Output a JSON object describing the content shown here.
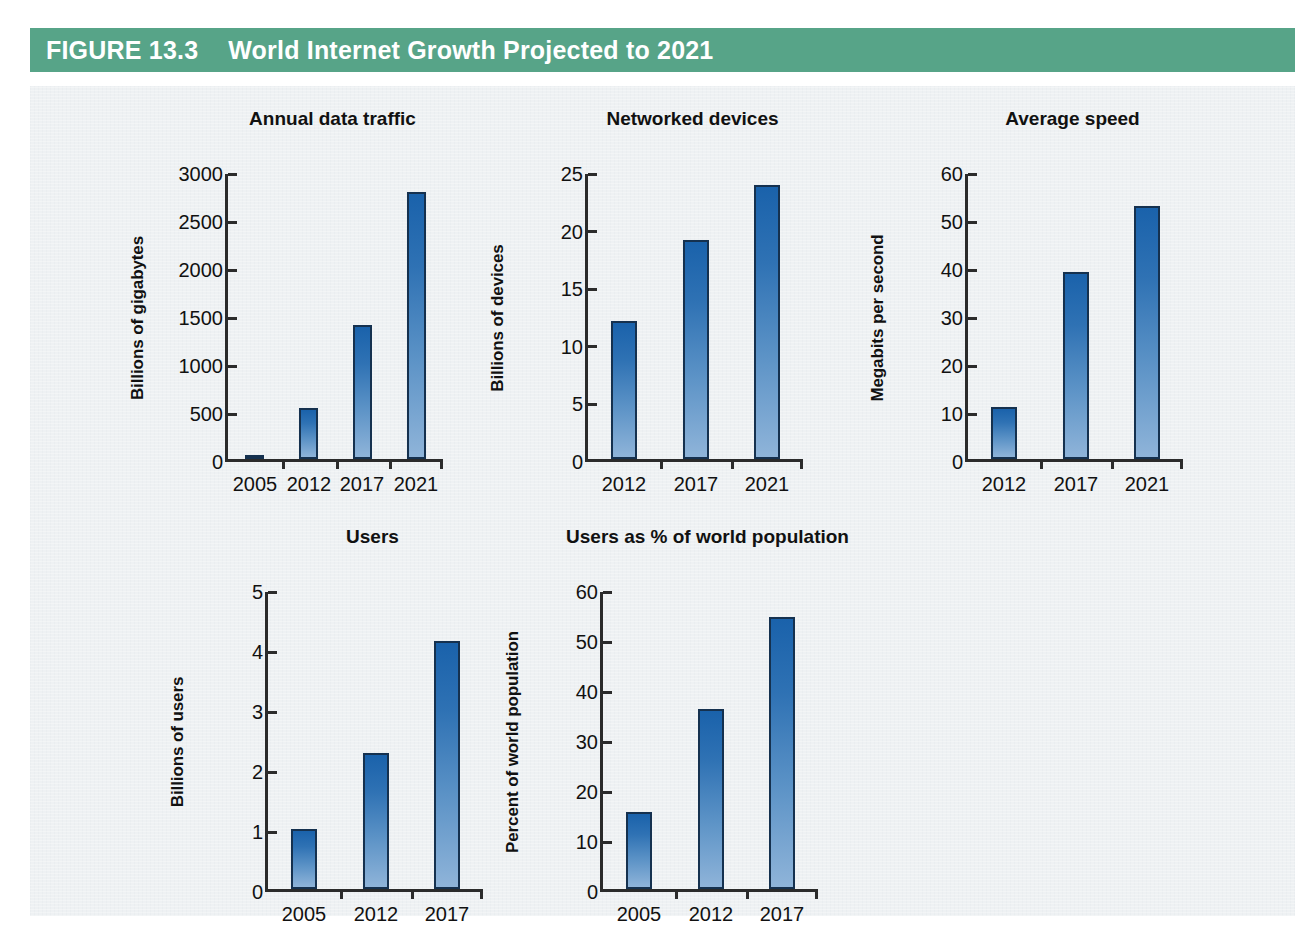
{
  "figure": {
    "number_label": "FIGURE 13.3",
    "title": "World Internet Growth Projected to 2021",
    "banner_color": "#57a488",
    "panel_color": "#eef1f3",
    "bar_color_top": "#1a62ab",
    "bar_color_bottom": "#8fb4d9",
    "bar_border_color": "#15314f",
    "axis_color": "#2b2b2b"
  },
  "chart_data": [
    {
      "type": "bar",
      "title": "Annual data traffic",
      "xlabel": "",
      "ylabel": "Billions of gigabytes",
      "categories": [
        "2005",
        "2012",
        "2017",
        "2021"
      ],
      "values": [
        40,
        530,
        1400,
        2780
      ],
      "yticks": [
        "0",
        "500",
        "1000",
        "1500",
        "2000",
        "2500",
        "3000"
      ],
      "ytick_values": [
        0,
        500,
        1000,
        1500,
        2000,
        2500,
        3000
      ],
      "ylim": [
        0,
        3000
      ],
      "grid": false,
      "legend": "none"
    },
    {
      "type": "bar",
      "title": "Networked devices",
      "xlabel": "",
      "ylabel": "Billions of devices",
      "categories": [
        "2012",
        "2017",
        "2021"
      ],
      "values": [
        12.0,
        19.0,
        23.8
      ],
      "yticks": [
        "0",
        "5",
        "10",
        "15",
        "20",
        "25"
      ],
      "ytick_values": [
        0,
        5,
        10,
        15,
        20,
        25
      ],
      "ylim": [
        0,
        25
      ],
      "grid": false,
      "legend": "none"
    },
    {
      "type": "bar",
      "title": "Average speed",
      "xlabel": "",
      "ylabel": "Megabits per second",
      "categories": [
        "2012",
        "2017",
        "2021"
      ],
      "values": [
        10.9,
        39.0,
        52.8
      ],
      "yticks": [
        "0",
        "10",
        "20",
        "30",
        "40",
        "50",
        "60"
      ],
      "ytick_values": [
        0,
        10,
        20,
        30,
        40,
        50,
        60
      ],
      "ylim": [
        0,
        60
      ],
      "grid": false,
      "legend": "none"
    },
    {
      "type": "bar",
      "title": "Users",
      "xlabel": "",
      "ylabel": "Billions of users",
      "categories": [
        "2005",
        "2012",
        "2017"
      ],
      "values": [
        1.0,
        2.27,
        4.13
      ],
      "yticks": [
        "0",
        "1",
        "2",
        "3",
        "4",
        "5"
      ],
      "ytick_values": [
        0,
        1,
        2,
        3,
        4,
        5
      ],
      "ylim": [
        0,
        5
      ],
      "grid": false,
      "legend": "none"
    },
    {
      "type": "bar",
      "title": "Users as % of world population",
      "xlabel": "",
      "ylabel": "Percent of world population",
      "categories": [
        "2005",
        "2012",
        "2017"
      ],
      "values": [
        15.5,
        36.0,
        54.5
      ],
      "yticks": [
        "0",
        "10",
        "20",
        "30",
        "40",
        "50",
        "60"
      ],
      "ytick_values": [
        0,
        10,
        20,
        30,
        40,
        50,
        60
      ],
      "ylim": [
        0,
        60
      ],
      "grid": false,
      "legend": "none"
    }
  ]
}
